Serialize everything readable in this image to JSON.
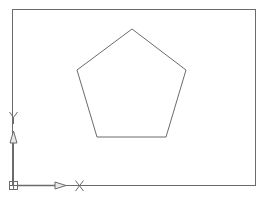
{
  "drawing": {
    "background": "#ffffff",
    "line_color": "#6b6b6b",
    "border_rect": {
      "x": 12,
      "y": 9,
      "width": 243,
      "height": 176
    },
    "pentagon": {
      "points": [
        [
          132,
          29
        ],
        [
          186,
          70
        ],
        [
          166,
          137
        ],
        [
          97,
          137
        ],
        [
          77,
          70
        ]
      ]
    },
    "ucs_icon": {
      "origin": [
        13,
        185
      ],
      "x_axis_label": "X",
      "y_axis_label": "Y"
    }
  }
}
